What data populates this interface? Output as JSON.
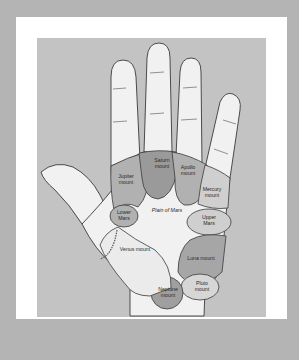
{
  "diagram": {
    "colors": {
      "outer_background": "#b4b4b4",
      "frame": "#ffffff",
      "panel": "#c3c3c3",
      "skin": "#f1f1f1",
      "mount_light": "#cfcfcf",
      "mount_mid": "#b1b1b1",
      "mount_dark": "#9a9a9a",
      "outline": "#3a3a3a"
    },
    "regions": [
      {
        "id": "jupiter",
        "line1": "Jupiter",
        "line2": "mount"
      },
      {
        "id": "saturn",
        "line1": "Saturn",
        "line2": "mount"
      },
      {
        "id": "apollo",
        "line1": "Apollo",
        "line2": "mount"
      },
      {
        "id": "mercury",
        "line1": "Mercury",
        "line2": "mount"
      },
      {
        "id": "lower-mars",
        "line1": "Lower",
        "line2": "Mars"
      },
      {
        "id": "plain-of-mars",
        "line1": "Plain of Mars"
      },
      {
        "id": "upper-mars",
        "line1": "Upper",
        "line2": "Mars"
      },
      {
        "id": "venus",
        "line1": "Venus mount"
      },
      {
        "id": "luna",
        "line1": "Luna mount"
      },
      {
        "id": "neptune",
        "line1": "Neptune",
        "line2": "mount"
      },
      {
        "id": "pluto",
        "line1": "Pluto",
        "line2": "mount"
      }
    ]
  }
}
